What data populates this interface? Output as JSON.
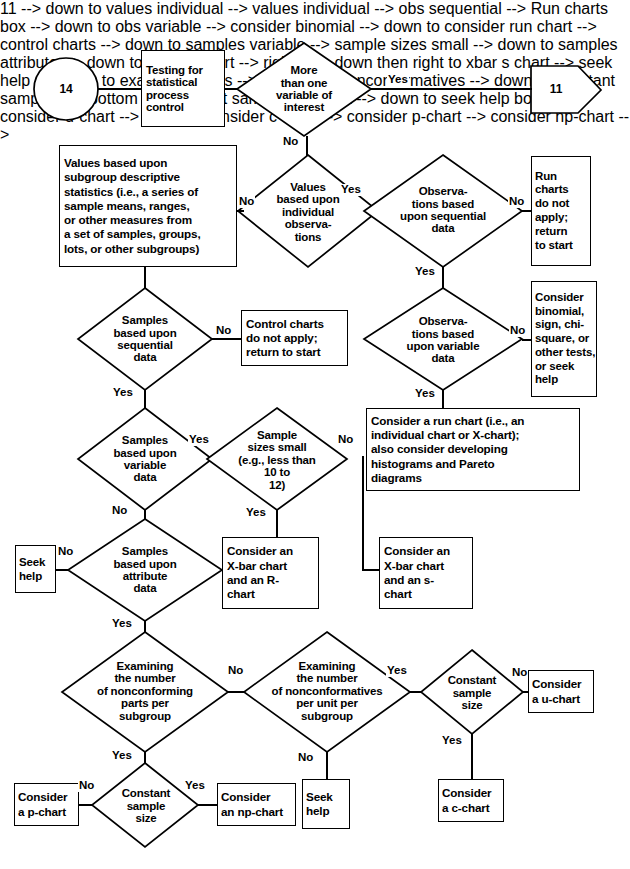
{
  "connectors": {
    "yes": "Yes",
    "no": "No"
  },
  "nodes": {
    "start_circle": {
      "label": "14",
      "shape": "circle"
    },
    "testing_spc": {
      "label": "Testing for\nstatistical\nprocess\ncontrol",
      "shape": "box"
    },
    "more_than_one_var": {
      "label": "More\nthan one\nvariable of\ninterest",
      "shape": "diamond"
    },
    "goto_11": {
      "label": "11",
      "shape": "pentagon"
    },
    "values_subgroup": {
      "label": "Values based upon\nsubgroup descriptive\nstatistics (i.e., a series of\nsample means, ranges,\nor other measures from\na set of samples, groups,\nlots, or other subgroups)",
      "shape": "box"
    },
    "values_individual": {
      "label": "Values\nbased upon\nindividual\nobserva-\ntions",
      "shape": "diamond"
    },
    "obs_sequential": {
      "label": "Observa-\ntions based\nupon sequential\ndata",
      "shape": "diamond"
    },
    "run_charts_na": {
      "label": "Run\ncharts\ndo not\napply;\nreturn\nto start",
      "shape": "box"
    },
    "samples_sequential": {
      "label": "Samples\nbased upon\nsequential\ndata",
      "shape": "diamond"
    },
    "control_charts_na": {
      "label": "Control charts\ndo not apply;\nreturn to start",
      "shape": "box"
    },
    "obs_variable": {
      "label": "Observa-\ntions based\nupon variable\ndata",
      "shape": "diamond"
    },
    "consider_binomial": {
      "label": "Consider\nbinomial,\nsign, chi-\nsquare, or\nother tests,\nor seek\nhelp",
      "shape": "box"
    },
    "samples_variable": {
      "label": "Samples\nbased upon\nvariable\ndata",
      "shape": "diamond"
    },
    "sample_sizes_small": {
      "label": "Sample\nsizes small\n(e.g., less than\n10 to\n12)",
      "shape": "diamond"
    },
    "consider_run_chart": {
      "label": "Consider a run chart (i.e., an\nindividual chart or X-chart);\nalso consider developing\nhistograms and Pareto\ndiagrams",
      "shape": "box"
    },
    "seek_help_left": {
      "label": "Seek\nhelp",
      "shape": "box"
    },
    "samples_attribute": {
      "label": "Samples\nbased upon\nattribute\ndata",
      "shape": "diamond"
    },
    "xbar_r_chart": {
      "label": "Consider an\nX-bar chart\nand an R-\nchart",
      "shape": "box"
    },
    "xbar_s_chart": {
      "label": "Consider an\nX-bar chart\nand an s-\nchart",
      "shape": "box"
    },
    "examining_nonconforming_parts": {
      "label": "Examining\nthe number\nof nonconforming\nparts per\nsubgroup",
      "shape": "diamond"
    },
    "examining_nonconformatives": {
      "label": "Examining\nthe number\nof nonconformatives\nper unit per\nsubgroup",
      "shape": "diamond"
    },
    "constant_sample_size_right": {
      "label": "Constant\nsample\nsize",
      "shape": "diamond"
    },
    "consider_u_chart": {
      "label": "Consider\na u-chart",
      "shape": "box"
    },
    "consider_p_chart": {
      "label": "Consider\na p-chart",
      "shape": "box"
    },
    "constant_sample_size_bottom": {
      "label": "Constant\nsample\nsize",
      "shape": "diamond"
    },
    "consider_np_chart": {
      "label": "Consider\nan np-chart",
      "shape": "box"
    },
    "seek_help_bottom": {
      "label": "Seek\nhelp",
      "shape": "box"
    },
    "consider_c_chart": {
      "label": "Consider\na c-chart",
      "shape": "box"
    }
  },
  "edge_labels": {
    "more_than_one_var_yes": "Yes",
    "more_than_one_var_no": "No",
    "values_subgroup_no": "No",
    "values_individual_yes": "Yes",
    "obs_sequential_no": "No",
    "obs_sequential_yes": "Yes",
    "obs_variable_no": "No",
    "obs_variable_yes": "Yes",
    "samples_sequential_no": "No",
    "samples_sequential_yes": "Yes",
    "samples_variable_yes": "Yes",
    "samples_variable_no": "No",
    "sample_sizes_small_no": "No",
    "sample_sizes_small_yes": "Yes",
    "samples_attribute_no": "No",
    "samples_attribute_yes": "Yes",
    "examining_parts_no": "No",
    "examining_parts_yes": "Yes",
    "examining_nonconf_yes": "Yes",
    "examining_nonconf_no": "No",
    "constant_right_no": "No",
    "constant_right_yes": "Yes",
    "constant_bottom_no": "No",
    "constant_bottom_yes": "Yes"
  },
  "colors": {
    "stroke": "#000000",
    "fill": "#ffffff",
    "background": "#ffffff"
  }
}
